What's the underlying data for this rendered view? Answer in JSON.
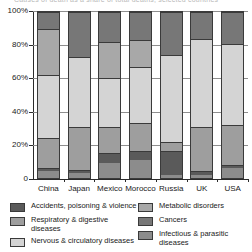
{
  "title_partial": "Causes of death as a share of total deaths, selected countries",
  "chart_data": {
    "type": "bar",
    "variant": "stacked-100-percent",
    "title": "",
    "xlabel": "",
    "ylabel": "",
    "ylim": [
      0,
      100
    ],
    "ytick_labels": [
      "0",
      "20%",
      "40%",
      "60%",
      "80%",
      "100%"
    ],
    "ytick_values": [
      0,
      20,
      40,
      60,
      80,
      100
    ],
    "grid": true,
    "legend_position": "bottom",
    "categories": [
      "China",
      "Japan",
      "Mexico",
      "Morocco",
      "Russia",
      "UK",
      "USA"
    ],
    "series": [
      {
        "name": "Infectious & parasitic diseases",
        "color": "#8c8c8c",
        "values": [
          4,
          3,
          9,
          11,
          2,
          2,
          6
        ]
      },
      {
        "name": "Accidents, poisoning & violence",
        "color": "#5a5a5a",
        "values": [
          2,
          2,
          6,
          5,
          14,
          2,
          2
        ]
      },
      {
        "name": "Respiratory & digestive diseases",
        "color": "#9e9e9e",
        "values": [
          18,
          26,
          16,
          17,
          6,
          27,
          24
        ]
      },
      {
        "name": "Nervous & circulatory diseases",
        "color": "#d4d4d4",
        "values": [
          38,
          42,
          29,
          34,
          52,
          53,
          49
        ]
      },
      {
        "name": "Metabolic disorders",
        "color": "#a8a8a8",
        "values": [
          28,
          0,
          22,
          16,
          0,
          0,
          0
        ]
      },
      {
        "name": "Cancers",
        "color": "#777777",
        "values": [
          10,
          27,
          18,
          17,
          26,
          16,
          19
        ]
      }
    ]
  },
  "legend": {
    "left_column": [
      {
        "label": "Accidents, poisoning & violence",
        "color": "#5a5a5a"
      },
      {
        "label": "Respiratory & digestive diseases",
        "color": "#9e9e9e"
      },
      {
        "label": "Nervous & circulatory diseases",
        "color": "#d4d4d4"
      }
    ],
    "right_column": [
      {
        "label": "Metabolic disorders",
        "color": "#a8a8a8"
      },
      {
        "label": "Cancers",
        "color": "#777777"
      },
      {
        "label": "Infectious & parasitic diseases",
        "color": "#8c8c8c"
      }
    ]
  }
}
